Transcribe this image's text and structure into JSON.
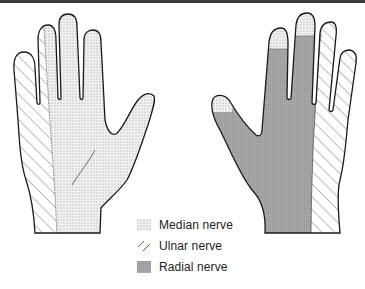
{
  "figure": {
    "left_hand": {
      "view": "palmar"
    },
    "right_hand": {
      "view": "dorsal"
    }
  },
  "legend": {
    "items": [
      {
        "label": "Median nerve",
        "pattern": "dots"
      },
      {
        "label": "Ulnar nerve",
        "pattern": "diagonal-lines"
      },
      {
        "label": "Radial nerve",
        "pattern": "dense-shading"
      }
    ]
  },
  "colors": {
    "outline": "#1a1a1a",
    "median_fill": "#e9e9e9",
    "radial_fill": "#a8a8a8",
    "topbar": "#3a3a3a"
  }
}
